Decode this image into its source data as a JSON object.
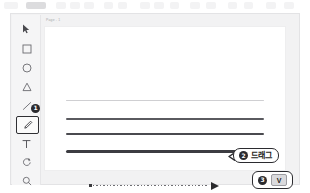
{
  "app": {
    "window_title": "",
    "canvas_tab_label": "Page - 1"
  },
  "top_toolbar": {
    "visible_fragment": true,
    "chips": [
      {
        "x": 4,
        "w": 14,
        "shade": "light"
      },
      {
        "x": 26,
        "w": 20,
        "shade": "dark"
      },
      {
        "x": 56,
        "w": 10,
        "shade": "light"
      },
      {
        "x": 70,
        "w": 10,
        "shade": "light"
      },
      {
        "x": 84,
        "w": 10,
        "shade": "light"
      },
      {
        "x": 104,
        "w": 9,
        "shade": "light"
      },
      {
        "x": 118,
        "w": 9,
        "shade": "light"
      },
      {
        "x": 140,
        "w": 10,
        "shade": "light"
      },
      {
        "x": 154,
        "w": 10,
        "shade": "light"
      },
      {
        "x": 170,
        "w": 9,
        "shade": "light"
      },
      {
        "x": 190,
        "w": 10,
        "shade": "light"
      },
      {
        "x": 206,
        "w": 10,
        "shade": "light"
      },
      {
        "x": 228,
        "w": 9,
        "shade": "light"
      },
      {
        "x": 244,
        "w": 9,
        "shade": "light"
      },
      {
        "x": 266,
        "w": 10,
        "shade": "light"
      },
      {
        "x": 284,
        "w": 10,
        "shade": "light"
      }
    ]
  },
  "toolbar": {
    "tools": [
      {
        "icon": "cursor-arrow-icon",
        "label": "Select",
        "y": 6,
        "selected": false
      },
      {
        "icon": "square-icon",
        "label": "Rectangle",
        "y": 26,
        "selected": false
      },
      {
        "icon": "circle-icon",
        "label": "Ellipse",
        "y": 45,
        "selected": false
      },
      {
        "icon": "triangle-icon",
        "label": "Triangle",
        "y": 64,
        "selected": false
      },
      {
        "icon": "line-icon",
        "label": "Line",
        "y": 83,
        "selected": false
      },
      {
        "icon": "pen-icon",
        "label": "Pen",
        "y": 101,
        "selected": true
      },
      {
        "icon": "text-icon",
        "label": "Text",
        "y": 121,
        "selected": false
      },
      {
        "icon": "rotate-icon",
        "label": "Rotate",
        "y": 139,
        "selected": false
      },
      {
        "icon": "magnifier-icon",
        "label": "Zoom",
        "y": 158,
        "selected": false
      }
    ]
  },
  "canvas": {
    "strokes": [
      {
        "name": "stroke-hairline",
        "top": 73,
        "thickness": 0.8,
        "color": "#cfcfd2"
      },
      {
        "name": "stroke-thin",
        "top": 91,
        "thickness": 1.6,
        "color": "#5a5a5f"
      },
      {
        "name": "stroke-medium",
        "top": 106,
        "thickness": 2.2,
        "color": "#4a4a4f"
      },
      {
        "name": "stroke-thick",
        "top": 123,
        "thickness": 3.0,
        "color": "#3c3c41"
      }
    ],
    "gesture": {
      "name": "drag-gesture-arrow",
      "style": "dotted-with-arrowhead",
      "direction": "left-to-right"
    },
    "guide": {
      "name": "guide-line",
      "handles": 2
    }
  },
  "callouts": {
    "step1": {
      "badge": "1"
    },
    "step2": {
      "badge": "2",
      "text": "드래그"
    },
    "step3": {
      "badge": "3",
      "key": "V"
    }
  },
  "colors": {
    "badge_bg": "#2b2b2f",
    "badge_fg": "#ffffff",
    "outline": "#2b2b2f",
    "panel_bg": "#f2f2f3",
    "rail_bg": "#f5f5f6",
    "page_bg": "#ffffff",
    "keycap_bg": "#dadadd"
  }
}
